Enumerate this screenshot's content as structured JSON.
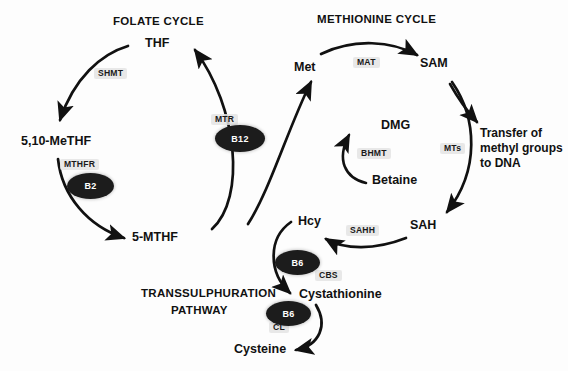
{
  "diagram": {
    "background_color": "#fdfdfd",
    "ink_color": "#111111",
    "vitamin_fill": "#1c1c1c",
    "vitamin_text_color": "#ffffff",
    "enzyme_highlight_color": "#e4e4e4",
    "sections": [
      {
        "id": "folate",
        "label": "FOLATE CYCLE"
      },
      {
        "id": "methionine",
        "label": "METHIONINE CYCLE"
      },
      {
        "id": "transsulphuration_line1",
        "label": "TRANSSULPHURATION"
      },
      {
        "id": "transsulphuration_line2",
        "label": "PATHWAY"
      }
    ],
    "metabolites": [
      {
        "id": "thf",
        "label": "THF"
      },
      {
        "id": "me_thf",
        "label": "5,10-MeTHF"
      },
      {
        "id": "mthf",
        "label": "5-MTHF"
      },
      {
        "id": "met",
        "label": "Met"
      },
      {
        "id": "sam",
        "label": "SAM"
      },
      {
        "id": "sah",
        "label": "SAH"
      },
      {
        "id": "hcy",
        "label": "Hcy"
      },
      {
        "id": "dmg",
        "label": "DMG"
      },
      {
        "id": "betaine",
        "label": "Betaine"
      },
      {
        "id": "cystathionine",
        "label": "Cystathionine"
      },
      {
        "id": "cysteine",
        "label": "Cysteine"
      },
      {
        "id": "methyl_transfer",
        "label": "Transfer of\nmethyl groups\nto DNA"
      }
    ],
    "enzymes": [
      {
        "id": "shmt",
        "label": "SHMT"
      },
      {
        "id": "mthfr",
        "label": "MTHFR"
      },
      {
        "id": "mtr",
        "label": "MTR"
      },
      {
        "id": "mat",
        "label": "MAT"
      },
      {
        "id": "bhmt",
        "label": "BHMT"
      },
      {
        "id": "mts",
        "label": "MTs"
      },
      {
        "id": "sahh",
        "label": "SAHH"
      },
      {
        "id": "cbs",
        "label": "CBS"
      },
      {
        "id": "cl",
        "label": "CL"
      }
    ],
    "vitamins": [
      {
        "id": "b12",
        "label": "B12"
      },
      {
        "id": "b2",
        "label": "B2"
      },
      {
        "id": "b6_cbs",
        "label": "B6"
      },
      {
        "id": "b6_cl",
        "label": "B6"
      }
    ],
    "reactions": [
      {
        "from": "THF",
        "to": "5,10-MeTHF",
        "enzyme": "SHMT"
      },
      {
        "from": "5,10-MeTHF",
        "to": "5-MTHF",
        "enzyme": "MTHFR",
        "cofactor": "B2"
      },
      {
        "from": "5-MTHF",
        "to": "THF",
        "enzyme": "MTR",
        "cofactor": "B12"
      },
      {
        "from": "Hcy",
        "to": "Met",
        "enzyme": "MTR",
        "cofactor": "B12"
      },
      {
        "from": "Met",
        "to": "SAM",
        "enzyme": "MAT"
      },
      {
        "from": "SAM",
        "to": "SAH",
        "enzyme": "MTs"
      },
      {
        "from": "SAM",
        "to": "Transfer of methyl groups to DNA",
        "enzyme": "MTs"
      },
      {
        "from": "SAH",
        "to": "Hcy",
        "enzyme": "SAHH"
      },
      {
        "from": "Betaine",
        "to": "DMG",
        "enzyme": "BHMT"
      },
      {
        "from": "Hcy",
        "to": "Cystathionine",
        "enzyme": "CBS",
        "cofactor": "B6"
      },
      {
        "from": "Cystathionine",
        "to": "Cysteine",
        "enzyme": "CL",
        "cofactor": "B6"
      }
    ]
  }
}
